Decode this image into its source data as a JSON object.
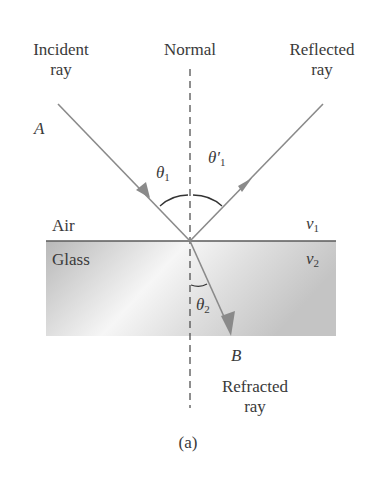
{
  "figure": {
    "labels": {
      "incident_ray_line1": "Incident",
      "incident_ray_line2": "ray",
      "normal": "Normal",
      "reflected_ray_line1": "Reflected",
      "reflected_ray_line2": "ray",
      "point_a": "A",
      "point_b": "B",
      "theta_1": "θ",
      "theta_1_sub": "1",
      "theta_1_prime": "θ′",
      "theta_1_prime_sub": "1",
      "theta_2": "θ",
      "theta_2_sub": "2",
      "medium_top": "Air",
      "medium_bottom": "Glass",
      "speed_top": "v",
      "speed_top_sub": "1",
      "speed_bottom": "v",
      "speed_bottom_sub": "2",
      "refracted_ray_line1": "Refracted",
      "refracted_ray_line2": "ray",
      "caption": "(a)"
    },
    "colors": {
      "ray": "#8a8a8a",
      "interface": "#555555",
      "normal": "#444444",
      "glass_edge": "#bdbdbd",
      "glass_center": "#f4f4f4"
    }
  }
}
